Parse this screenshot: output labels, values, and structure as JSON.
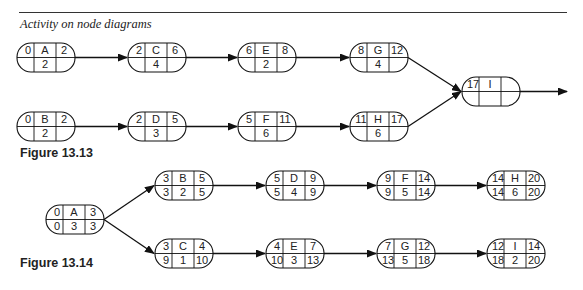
{
  "header": {
    "title": "Activity on node diagrams"
  },
  "figures": [
    {
      "label": "Figure 13.13",
      "nodes": [
        {
          "id": "A",
          "es": "0",
          "ef": "2",
          "dur": "2",
          "ls": "",
          "lf": "",
          "x": 17,
          "y": 43
        },
        {
          "id": "C",
          "es": "2",
          "ef": "6",
          "dur": "4",
          "ls": "",
          "lf": "",
          "x": 128,
          "y": 43
        },
        {
          "id": "E",
          "es": "6",
          "ef": "8",
          "dur": "2",
          "ls": "",
          "lf": "",
          "x": 238,
          "y": 43
        },
        {
          "id": "G",
          "es": "8",
          "ef": "12",
          "dur": "4",
          "ls": "",
          "lf": "",
          "x": 350,
          "y": 43
        },
        {
          "id": "B",
          "es": "0",
          "ef": "2",
          "dur": "2",
          "ls": "",
          "lf": "",
          "x": 17,
          "y": 112
        },
        {
          "id": "D",
          "es": "2",
          "ef": "5",
          "dur": "3",
          "ls": "",
          "lf": "",
          "x": 128,
          "y": 112
        },
        {
          "id": "F",
          "es": "5",
          "ef": "11",
          "dur": "6",
          "ls": "",
          "lf": "",
          "x": 238,
          "y": 112
        },
        {
          "id": "H",
          "es": "11",
          "ef": "17",
          "dur": "6",
          "ls": "",
          "lf": "",
          "x": 350,
          "y": 112
        },
        {
          "id": "I",
          "es": "17",
          "ef": "",
          "dur": "",
          "ls": "",
          "lf": "",
          "x": 462,
          "y": 77
        }
      ],
      "edges": [
        [
          "A",
          "C"
        ],
        [
          "C",
          "E"
        ],
        [
          "E",
          "G"
        ],
        [
          "G",
          "I"
        ],
        [
          "B",
          "D"
        ],
        [
          "D",
          "F"
        ],
        [
          "F",
          "H"
        ],
        [
          "H",
          "I"
        ],
        [
          "I",
          "end"
        ]
      ]
    },
    {
      "label": "Figure 13.14",
      "nodes": [
        {
          "id": "A",
          "es": "0",
          "ef": "3",
          "ls": "0",
          "dur": "3",
          "lf": "3",
          "x": 46,
          "y": 205
        },
        {
          "id": "B",
          "es": "3",
          "ef": "5",
          "ls": "3",
          "dur": "2",
          "lf": "5",
          "x": 155,
          "y": 171
        },
        {
          "id": "D",
          "es": "5",
          "ef": "9",
          "ls": "5",
          "dur": "4",
          "lf": "9",
          "x": 266,
          "y": 171
        },
        {
          "id": "F",
          "es": "9",
          "ef": "14",
          "ls": "9",
          "dur": "5",
          "lf": "14",
          "x": 377,
          "y": 171
        },
        {
          "id": "H",
          "es": "14",
          "ef": "20",
          "ls": "14",
          "dur": "6",
          "lf": "20",
          "x": 487,
          "y": 171
        },
        {
          "id": "C",
          "es": "3",
          "ef": "4",
          "ls": "9",
          "dur": "1",
          "lf": "10",
          "x": 155,
          "y": 239
        },
        {
          "id": "E",
          "es": "4",
          "ef": "7",
          "ls": "10",
          "dur": "3",
          "lf": "13",
          "x": 266,
          "y": 239
        },
        {
          "id": "G",
          "es": "7",
          "ef": "12",
          "ls": "13",
          "dur": "5",
          "lf": "18",
          "x": 377,
          "y": 239
        },
        {
          "id": "I",
          "es": "12",
          "ef": "14",
          "ls": "18",
          "dur": "2",
          "lf": "20",
          "x": 487,
          "y": 239
        }
      ],
      "edges": [
        [
          "A",
          "B"
        ],
        [
          "A",
          "C"
        ],
        [
          "B",
          "D"
        ],
        [
          "D",
          "F"
        ],
        [
          "F",
          "H"
        ],
        [
          "C",
          "E"
        ],
        [
          "E",
          "G"
        ],
        [
          "G",
          "I"
        ]
      ]
    }
  ]
}
